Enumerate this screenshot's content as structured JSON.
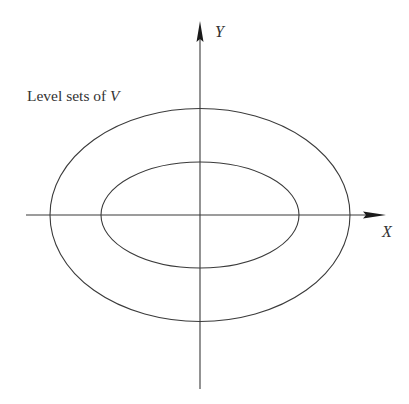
{
  "figure": {
    "caption_label": {
      "text": "Level sets of ",
      "variable": "V"
    },
    "axes": {
      "x_label": "X",
      "y_label": "Y",
      "origin": [
        200,
        215
      ],
      "x_axis": {
        "from": 26,
        "to": 386
      },
      "y_axis": {
        "from": 389,
        "to": 21
      }
    },
    "level_sets": [
      {
        "name": "inner",
        "cx": 200,
        "cy": 215,
        "rx": 99,
        "ry": 53
      },
      {
        "name": "outer",
        "cx": 200,
        "cy": 215,
        "rx": 150,
        "ry": 106.5
      }
    ],
    "colors": {
      "line": "#3a3a3a",
      "arrow": "#1a1a1a",
      "text": "#333333",
      "background": "#ffffff"
    }
  }
}
